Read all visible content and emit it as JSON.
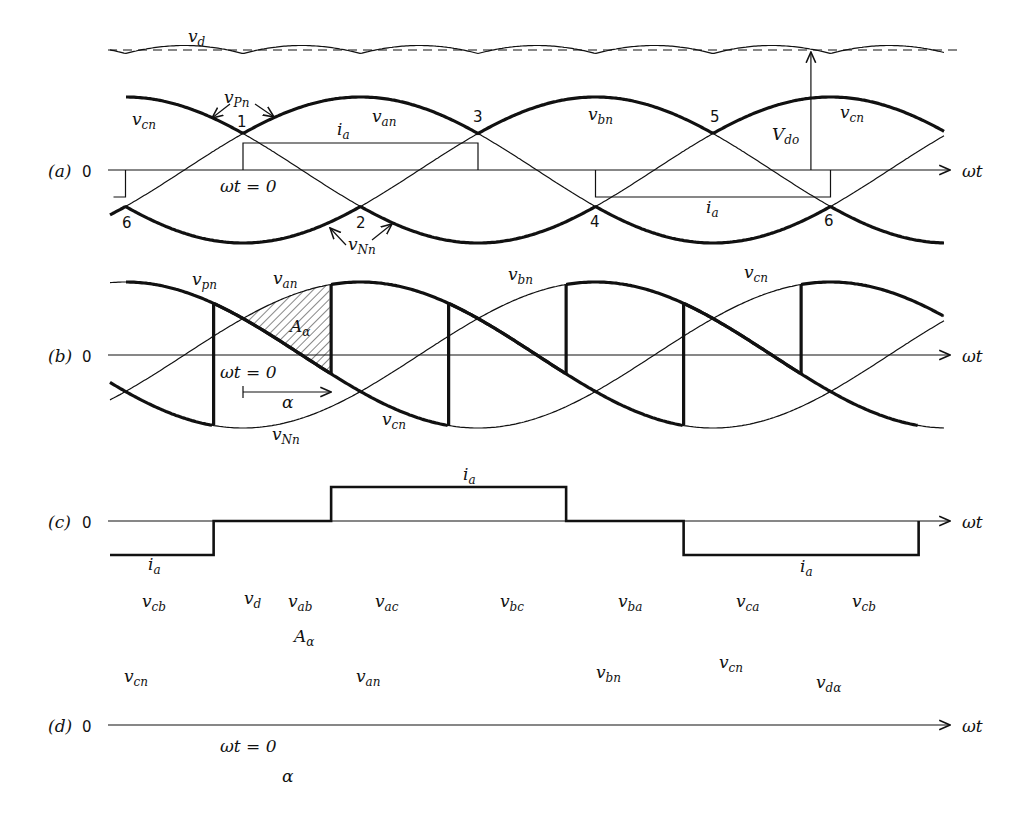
{
  "figure": {
    "x_axis_label": "ωt",
    "zero_label": "0",
    "panels": [
      {
        "id": "a",
        "tag": "(a)"
      },
      {
        "id": "b",
        "tag": "(b)"
      },
      {
        "id": "c",
        "tag": "(c)"
      },
      {
        "id": "d",
        "tag": "(d)"
      }
    ],
    "firing_delay_deg": 45
  },
  "labels": {
    "vd": "v",
    "vd_sub": "d",
    "vPn": "v",
    "vPn_sub": "Pn",
    "vNn": "v",
    "vNn_sub": "Nn",
    "vpn": "v",
    "vpn_sub": "pn",
    "van": "v",
    "van_sub": "an",
    "vbn": "v",
    "vbn_sub": "bn",
    "vcn": "v",
    "vcn_sub": "cn",
    "ia": "i",
    "ia_sub": "a",
    "Vdo": "V",
    "Vdo_sub": "do",
    "wt0": "ωt = 0",
    "alpha": "α",
    "Aalpha": "A",
    "Aalpha_sub": "α",
    "vcb": "v",
    "vcb_sub": "cb",
    "vab": "v",
    "vab_sub": "ab",
    "vac": "v",
    "vac_sub": "ac",
    "vbc": "v",
    "vbc_sub": "bc",
    "vba": "v",
    "vba_sub": "ba",
    "vca": "v",
    "vca_sub": "ca",
    "vdalpha": "v",
    "vdalpha_sub": "dα"
  },
  "commutation_points": [
    "1",
    "2",
    "3",
    "4",
    "5",
    "6",
    "6"
  ]
}
